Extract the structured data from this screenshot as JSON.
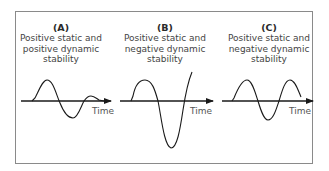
{
  "panels": [
    {
      "letter": "(A)",
      "line1": "Positive static and",
      "line2": "positive dynamic",
      "line3": "stability",
      "axis_label": "Time",
      "behavior": "damped oscillation"
    },
    {
      "letter": "(B)",
      "line1": "Positive static and",
      "line2": "negative dynamic",
      "line3": "stability",
      "axis_label": "Time",
      "behavior": "divergent oscillation"
    },
    {
      "letter": "(C)",
      "line1": "Positive static and",
      "line2": "negative dynamic",
      "line3": "stability",
      "axis_label": "Time",
      "behavior": "constant-amplitude oscillation"
    }
  ],
  "colors": {
    "frame": "#8a8a8a",
    "curve": "#1a1a1a",
    "axis": "#1a1a1a",
    "text": "#444444"
  }
}
